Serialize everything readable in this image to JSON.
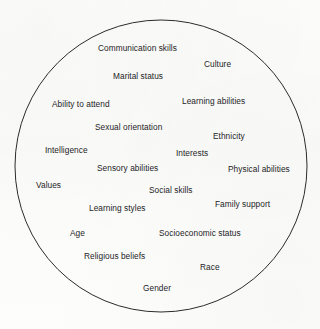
{
  "diagram": {
    "type": "circle-word-cloud",
    "title": "",
    "shape": {
      "name": "circle-outline",
      "stroke_color": "#2b2b2b",
      "fill_color": "none",
      "stroke_width": 1,
      "center_x": 161,
      "center_y": 166,
      "radius_x": 146,
      "radius_y": 146
    },
    "background_color": "#fdfdfc",
    "text_color": "#1d1d1f",
    "label_count": 20,
    "labels": [
      {
        "text": "Communication skills",
        "x": 98,
        "y": 43
      },
      {
        "text": "Culture",
        "x": 204,
        "y": 59
      },
      {
        "text": "Marital status",
        "x": 113,
        "y": 71
      },
      {
        "text": "Ability to attend",
        "x": 52,
        "y": 99
      },
      {
        "text": "Learning abilities",
        "x": 182,
        "y": 96
      },
      {
        "text": "Sexual orientation",
        "x": 95,
        "y": 122
      },
      {
        "text": "Ethnicity",
        "x": 213,
        "y": 131
      },
      {
        "text": "Intelligence",
        "x": 45,
        "y": 145
      },
      {
        "text": "Interests",
        "x": 176,
        "y": 148
      },
      {
        "text": "Sensory abilities",
        "x": 97,
        "y": 163
      },
      {
        "text": "Physical abilities",
        "x": 228,
        "y": 164
      },
      {
        "text": "Values",
        "x": 36,
        "y": 180
      },
      {
        "text": "Social skills",
        "x": 149,
        "y": 185
      },
      {
        "text": "Family support",
        "x": 215,
        "y": 199
      },
      {
        "text": "Learning styles",
        "x": 89,
        "y": 203
      },
      {
        "text": "Age",
        "x": 70,
        "y": 228
      },
      {
        "text": "Socioeconomic status",
        "x": 159,
        "y": 228
      },
      {
        "text": "Religious beliefs",
        "x": 84,
        "y": 251
      },
      {
        "text": "Race",
        "x": 200,
        "y": 262
      },
      {
        "text": "Gender",
        "x": 143,
        "y": 283
      }
    ]
  }
}
